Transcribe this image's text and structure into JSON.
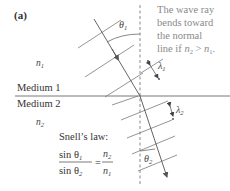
{
  "figure": {
    "panel_label": "(a)",
    "note_lines": [
      "The wave ray",
      "bends toward",
      "the normal",
      "line if n₂ > n₁."
    ],
    "note": {
      "line4_prefix": "line if ",
      "n": "n",
      "sub2": "2",
      "gt": " > ",
      "sub1": "1",
      "suffix": "."
    },
    "medium1": {
      "label": "Medium 1",
      "index_symbol": "n",
      "index_sub": "1"
    },
    "medium2": {
      "label": "Medium 2",
      "index_symbol": "n",
      "index_sub": "2"
    },
    "angles": {
      "incident": {
        "symbol": "θ",
        "sub": "1"
      },
      "refracted": {
        "symbol": "θ",
        "sub": "2"
      }
    },
    "wavelengths": {
      "medium1": {
        "symbol": "λ",
        "sub": "1"
      },
      "medium2": {
        "symbol": "λ",
        "sub": "2"
      }
    },
    "snells_law": {
      "title": "Snell’s law:",
      "numerator_left": "sin θ",
      "numerator_left_sub": "1",
      "denominator_left": "sin θ",
      "denominator_left_sub": "2",
      "equals": "=",
      "numerator_right": "n",
      "numerator_right_sub": "2",
      "denominator_right": "n",
      "denominator_right_sub": "1"
    },
    "colors": {
      "line": "#6a6a6a",
      "ray": "#555555",
      "note_text": "#8a8a8a",
      "label_text": "#333333"
    }
  }
}
